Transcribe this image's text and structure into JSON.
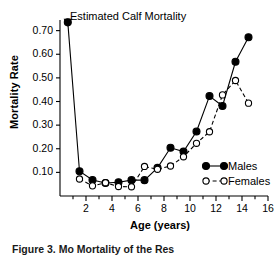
{
  "chart_data": {
    "type": "line",
    "title": "",
    "annotation": "Estimated Calf Mortality",
    "xlabel": "Age (years)",
    "ylabel": "Mortality Rate",
    "xlim": [
      0,
      16
    ],
    "ylim": [
      0.0,
      0.745
    ],
    "grid": false,
    "legend_position": "bottom-right",
    "xticks": [
      2,
      4,
      6,
      8,
      10,
      12,
      14,
      16
    ],
    "xtick_labels": [
      "2",
      "4",
      "6",
      "8",
      "10",
      "12",
      "14",
      "16"
    ],
    "xminor_step": 1,
    "yticks": [
      0.1,
      0.2,
      0.3,
      0.4,
      0.5,
      0.6,
      0.7
    ],
    "ytick_labels": [
      "0.10",
      "0.20",
      "0.30",
      "0.40",
      "0.50",
      "0.60",
      "0.70"
    ],
    "calf_point": {
      "x": 0.6,
      "y": 0.735,
      "marker": "triangle-down"
    },
    "series": [
      {
        "name": "Males",
        "marker": "filled-circle",
        "linestyle": "solid",
        "color": "#000000",
        "x": [
          0.6,
          1.5,
          2.5,
          3.5,
          4.5,
          5.5,
          6.5,
          7.5,
          8.5,
          9.5,
          10.5,
          11.5,
          12.5,
          13.5,
          14.5
        ],
        "y": [
          0.735,
          0.105,
          0.068,
          0.055,
          0.058,
          0.067,
          0.067,
          0.119,
          0.204,
          0.188,
          0.273,
          0.423,
          0.381,
          0.568,
          0.672
        ]
      },
      {
        "name": "Females",
        "marker": "open-circle",
        "linestyle": "dashed",
        "color": "#000000",
        "x": [
          1.5,
          2.5,
          3.5,
          4.5,
          5.5,
          6.5,
          7.5,
          8.5,
          9.5,
          10.5,
          11.5,
          12.5,
          13.5,
          14.5
        ],
        "y": [
          0.072,
          0.043,
          0.056,
          0.04,
          0.039,
          0.125,
          0.113,
          0.127,
          0.166,
          0.223,
          0.272,
          0.428,
          0.489,
          0.393
        ]
      }
    ]
  },
  "legend": {
    "males_label": "Males",
    "females_label": "Females"
  },
  "caption": {
    "text": "Figure 3. Mo  Mortality                          of the Res"
  }
}
